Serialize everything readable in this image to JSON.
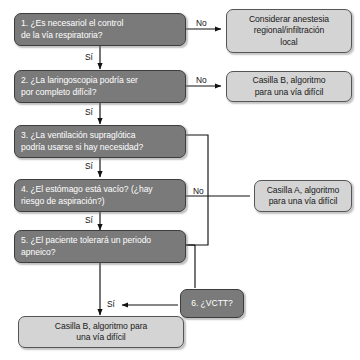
{
  "diagram": {
    "colors": {
      "question_fill": "#7a7a7a",
      "question_text": "#ffffff",
      "outcome_fill": "#d4d4d4",
      "outcome_text": "#1a1a1a",
      "line": "#1a1a1a",
      "background": "#ffffff"
    },
    "nodes": [
      {
        "id": "q1",
        "kind": "question",
        "number": "1.",
        "text": "1. ¿Es necesariol el control\n    de la vía respiratoria?"
      },
      {
        "id": "out1",
        "kind": "outcome",
        "text": "Considerar anestesia\nregional/infiltración\nlocal"
      },
      {
        "id": "q2",
        "kind": "question",
        "number": "2.",
        "text": "2. ¿La laringoscopia podría ser\n    por completo difícil?"
      },
      {
        "id": "out2",
        "kind": "outcome",
        "text": "Casilla B, algoritmo\npara una vía difícil"
      },
      {
        "id": "q3",
        "kind": "question",
        "number": "3.",
        "text": "3. ¿La ventilación supraglótica\n    podría usarse si hay necesidad?"
      },
      {
        "id": "q4",
        "kind": "question",
        "number": "4.",
        "text": "4. ¿El estómago está vacío? (¿hay\n    riesgo de aspiración?)"
      },
      {
        "id": "outA",
        "kind": "outcome",
        "text": "Casilla A, algoritmo\npara una vía difícil"
      },
      {
        "id": "q5",
        "kind": "question",
        "number": "5.",
        "text": "5. ¿El paciente tolerará un periodo\n    apneico?"
      },
      {
        "id": "q6",
        "kind": "question",
        "number": "6.",
        "text": "6. ¿VCTT?"
      },
      {
        "id": "out3",
        "kind": "outcome",
        "text": "Casilla B, algoritmo para\nuna vía difícil"
      }
    ],
    "edge_labels": {
      "q1_no": "No",
      "q1_si": "Sí",
      "q2_no": "No",
      "q2_si": "Sí",
      "q3_si": "Sí",
      "q4_no": "No",
      "q4_si": "Sí",
      "q5_si": "Sí"
    }
  }
}
